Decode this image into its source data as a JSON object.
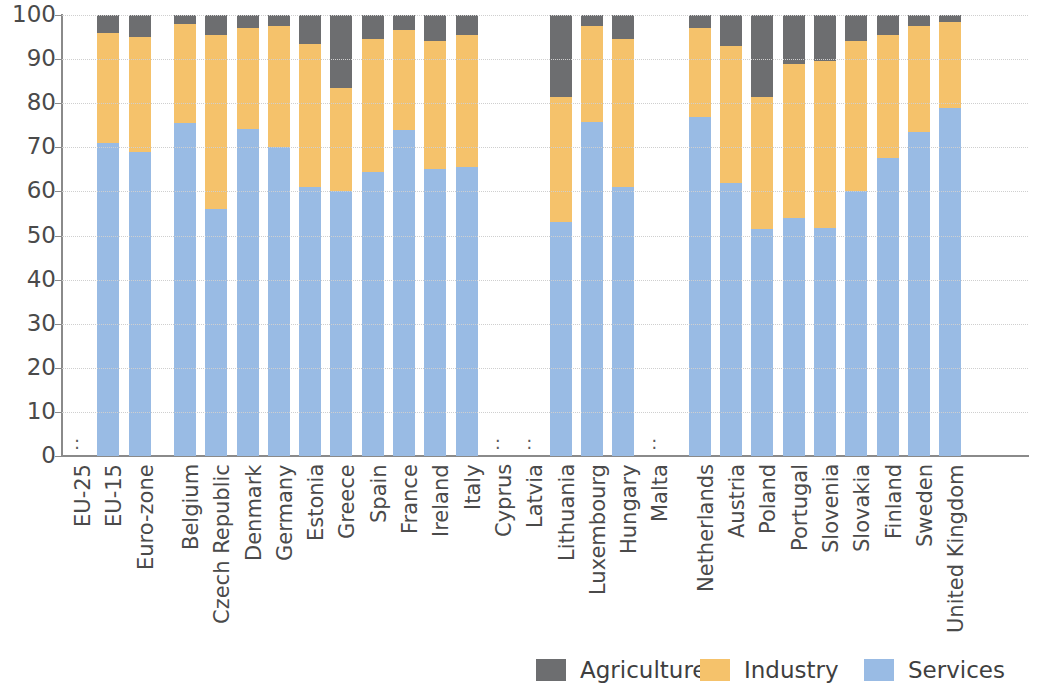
{
  "chart_data": {
    "type": "bar",
    "subtype": "stacked-bar-100-percent",
    "title": "",
    "subtitle": "",
    "xlabel": "",
    "ylabel": "",
    "ylim": [
      0,
      100
    ],
    "ytick_labels": [
      "0",
      "10",
      "20",
      "30",
      "40",
      "50",
      "60",
      "70",
      "80",
      "90",
      "100"
    ],
    "ytick_values": [
      0,
      10,
      20,
      30,
      40,
      50,
      60,
      70,
      80,
      90,
      100
    ],
    "grid": true,
    "grid_axis": "y",
    "legend_position": "bottom-right",
    "stack_order_bottom_to_top": [
      "Services",
      "Industry",
      "Agriculture"
    ],
    "missing_data_marker": ":",
    "categories": [
      "EU-25",
      "EU-15",
      "Euro-zone",
      "Belgium",
      "Czech Republic",
      "Denmark",
      "Germany",
      "Estonia",
      "Greece",
      "Spain",
      "France",
      "Ireland",
      "Italy",
      "Cyprus",
      "Latvia",
      "Lithuania",
      "Luxembourg",
      "Hungary",
      "Malta",
      "Netherlands",
      "Austria",
      "Poland",
      "Portugal",
      "Slovenia",
      "Slovakia",
      "Finland",
      "Sweden",
      "United Kingdom"
    ],
    "series": [
      {
        "name": "Services",
        "color": "#99bbe4",
        "values": [
          null,
          71.0,
          69.0,
          75.5,
          56.0,
          74.2,
          70.0,
          61.0,
          60.0,
          64.5,
          74.0,
          65.0,
          65.5,
          null,
          null,
          53.0,
          75.8,
          61.0,
          null,
          76.8,
          62.0,
          51.5,
          54.0,
          51.7,
          60.0,
          67.5,
          73.5,
          79.0
        ]
      },
      {
        "name": "Industry",
        "color": "#f5c26b",
        "values": [
          null,
          25.0,
          26.0,
          22.5,
          39.5,
          22.8,
          27.5,
          32.5,
          23.5,
          30.0,
          22.5,
          29.0,
          30.0,
          null,
          null,
          28.5,
          21.7,
          33.5,
          null,
          20.2,
          31.0,
          30.0,
          35.0,
          37.8,
          34.0,
          28.0,
          24.0,
          19.5
        ]
      },
      {
        "name": "Agriculture",
        "color": "#6d6e70",
        "values": [
          null,
          4.0,
          5.0,
          2.0,
          4.5,
          3.0,
          2.5,
          6.5,
          16.5,
          5.5,
          3.5,
          6.0,
          4.5,
          null,
          null,
          18.5,
          2.5,
          5.5,
          null,
          3.0,
          7.0,
          18.5,
          11.0,
          10.5,
          6.0,
          4.5,
          2.5,
          1.5
        ]
      }
    ],
    "missing_categories": [
      "EU-25",
      "Cyprus",
      "Latvia",
      "Malta"
    ]
  },
  "legend": {
    "items": [
      {
        "label": "Agriculture",
        "color": "#6d6e70"
      },
      {
        "label": "Industry",
        "color": "#f5c26b"
      },
      {
        "label": "Services",
        "color": "#99bbe4"
      }
    ]
  },
  "axis": {
    "y_max_label": "100",
    "y_min_label": "0"
  },
  "colors": {
    "agriculture": "#6d6e70",
    "industry": "#f5c26b",
    "services": "#99bbe4",
    "axis": "#8a8a8a",
    "grid": "#cfcfcf",
    "text": "#4a4a4a",
    "background": "#ffffff"
  }
}
